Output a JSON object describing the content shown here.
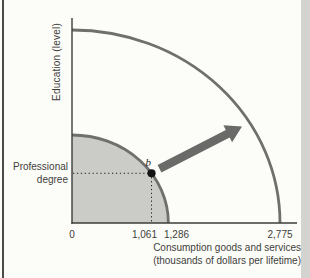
{
  "page": {
    "background": "#fcfcf8",
    "left_border_color": "#4a4a48",
    "right_band_color": "#d3d3d0"
  },
  "chart_data": {
    "type": "line",
    "xlabel": "Consumption goods and services (thousands of dollars per lifetime)",
    "xlabel_lines": [
      "Consumption goods and services",
      "(thousands of dollars per lifetime)"
    ],
    "ylabel": "Education (level)",
    "x_max": 2775,
    "x_ticks": [
      {
        "value": 0,
        "label": "0"
      },
      {
        "value": 1061,
        "label": "1,061"
      },
      {
        "value": 1286,
        "label": "1,286"
      },
      {
        "value": 2775,
        "label": "2,775"
      }
    ],
    "y_tick": {
      "label": "Professional degree",
      "lines": [
        "Professional",
        "degree"
      ]
    },
    "series": [
      {
        "name": "initial-ppf",
        "shape": "quarter-ellipse",
        "x_intercept": 1286,
        "filled": true
      },
      {
        "name": "expanded-ppf",
        "shape": "quarter-ellipse",
        "x_intercept": 2775,
        "filled": false
      }
    ],
    "points": [
      {
        "label": "b",
        "x": 1061,
        "y_label": "Professional degree",
        "on": "initial-ppf"
      }
    ],
    "annotations": [
      {
        "name": "outward-shift-arrow",
        "type": "arrow",
        "direction": "northeast"
      }
    ],
    "grid": false,
    "legend": "none",
    "colors": {
      "curve": "#6f6f6d",
      "fill": "#cbcbc8",
      "axis": "#3c3c3c",
      "arrow": "#6a6a68",
      "point": "#141414",
      "dotted": "#222222",
      "text": "#3e3e3c"
    }
  }
}
